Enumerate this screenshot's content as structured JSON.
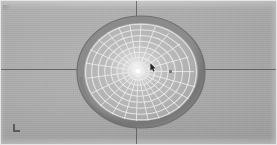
{
  "viewport": {
    "name": "3d-viewport",
    "background_color": "#a9a9a9",
    "width": 277,
    "height": 145,
    "label": "3D Viewport"
  },
  "scene": {
    "object_label": "Radial Dome Mesh",
    "description": "Wireframe hemispherical dome viewed from above with radial spoke and concentric ring grid",
    "shading": "flat-gray",
    "colors": {
      "ground": "#a9a9a9",
      "dome_rim": "#7c7c7c",
      "dome_surface": "#b5b5b5",
      "dome_highlight": "#f2f2f2",
      "wire": "#e8e8e8",
      "axis_line": "#4e4e4e",
      "cursor": "#2a2a2a"
    }
  },
  "dome": {
    "name": "dome-mesh",
    "center_x": 67,
    "center_y": 57,
    "radius_x": 64,
    "radius_y": 56,
    "rim_thickness": 7,
    "apex_x": 64,
    "apex_y": 56,
    "radial_spokes": 24,
    "concentric_rings": 9,
    "ring_radii_pct": [
      8,
      18,
      28,
      39,
      50,
      62,
      74,
      86,
      97
    ]
  },
  "axes": {
    "horizontal": {
      "name": "world-axis-horizontal",
      "y": 69,
      "color": "#4e4e4e"
    },
    "vertical": {
      "name": "world-axis-vertical",
      "x": 136,
      "color": "#4e4e4e"
    }
  },
  "markers": {
    "cursor": {
      "name": "mouse-cursor",
      "x": 150,
      "y": 63,
      "label": "cursor"
    },
    "point": {
      "name": "scene-point-marker",
      "x": 169,
      "y": 70,
      "label": "point"
    },
    "corner_top_left": {
      "name": "corner-artifact-top-left",
      "x": 3,
      "y": 5
    },
    "corner_bottom_left": {
      "name": "corner-artifact-bottom-left",
      "x": 13,
      "y": 124
    }
  }
}
